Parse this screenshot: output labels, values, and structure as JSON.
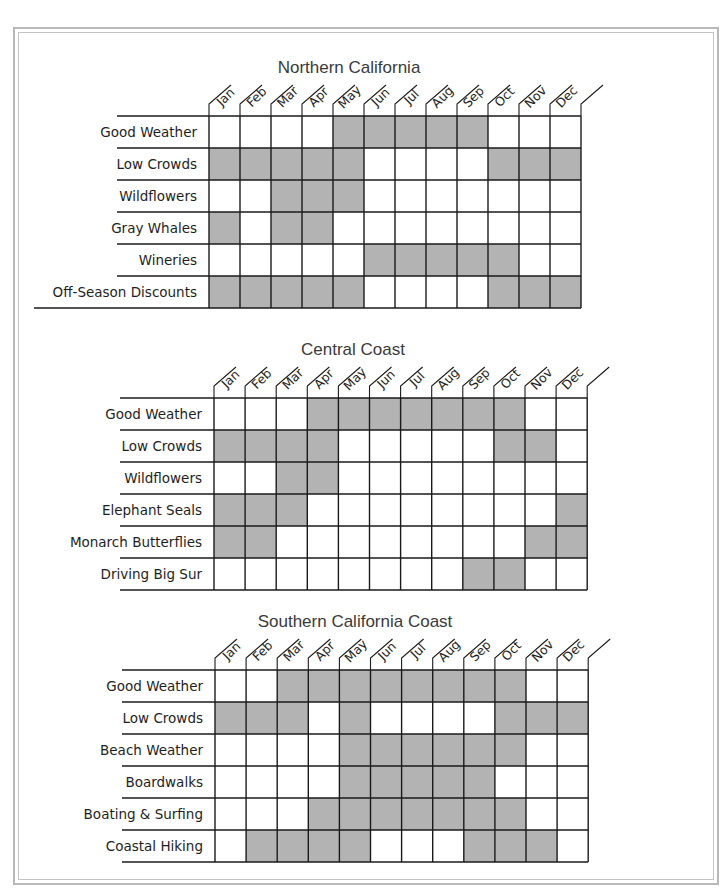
{
  "palette": {
    "filled": "#b3b3b3",
    "empty": "#ffffff",
    "line": "#1a1a1a",
    "frame": "#b9b9b9"
  },
  "months": [
    "Jan",
    "Feb",
    "Mar",
    "Apr",
    "May",
    "Jun",
    "Jul",
    "Aug",
    "Sep",
    "Oct",
    "Nov",
    "Dec"
  ],
  "chart_data": {
    "type": "heatmap",
    "title": "",
    "legend": "Shaded cell = recommended month for the activity/condition",
    "categories": [
      "Jan",
      "Feb",
      "Mar",
      "Apr",
      "May",
      "Jun",
      "Jul",
      "Aug",
      "Sep",
      "Oct",
      "Nov",
      "Dec"
    ],
    "sections": [
      {
        "title": "Northern California",
        "rows": [
          {
            "label": "Good Weather",
            "values": [
              0,
              0,
              0,
              0,
              1,
              1,
              1,
              1,
              1,
              0,
              0,
              0
            ]
          },
          {
            "label": "Low Crowds",
            "values": [
              1,
              1,
              1,
              1,
              1,
              0,
              0,
              0,
              0,
              1,
              1,
              1
            ]
          },
          {
            "label": "Wildflowers",
            "values": [
              0,
              0,
              1,
              1,
              1,
              0,
              0,
              0,
              0,
              0,
              0,
              0
            ]
          },
          {
            "label": "Gray Whales",
            "values": [
              1,
              0,
              1,
              1,
              0,
              0,
              0,
              0,
              0,
              0,
              0,
              0
            ]
          },
          {
            "label": "Wineries",
            "values": [
              0,
              0,
              0,
              0,
              0,
              1,
              1,
              1,
              1,
              1,
              0,
              0
            ]
          },
          {
            "label": "Off-Season Discounts",
            "values": [
              1,
              1,
              1,
              1,
              1,
              0,
              0,
              0,
              0,
              1,
              1,
              1
            ]
          }
        ]
      },
      {
        "title": "Central Coast",
        "rows": [
          {
            "label": "Good Weather",
            "values": [
              0,
              0,
              0,
              1,
              1,
              1,
              1,
              1,
              1,
              1,
              0,
              0
            ]
          },
          {
            "label": "Low Crowds",
            "values": [
              1,
              1,
              1,
              1,
              0,
              0,
              0,
              0,
              0,
              1,
              1,
              0
            ]
          },
          {
            "label": "Wildflowers",
            "values": [
              0,
              0,
              1,
              1,
              0,
              0,
              0,
              0,
              0,
              0,
              0,
              0
            ]
          },
          {
            "label": "Elephant Seals",
            "values": [
              1,
              1,
              1,
              0,
              0,
              0,
              0,
              0,
              0,
              0,
              0,
              1
            ]
          },
          {
            "label": "Monarch Butterflies",
            "values": [
              1,
              1,
              0,
              0,
              0,
              0,
              0,
              0,
              0,
              0,
              1,
              1
            ]
          },
          {
            "label": "Driving Big Sur",
            "values": [
              0,
              0,
              0,
              0,
              0,
              0,
              0,
              0,
              1,
              1,
              0,
              0
            ]
          }
        ]
      },
      {
        "title": "Southern California Coast",
        "rows": [
          {
            "label": "Good Weather",
            "values": [
              0,
              0,
              1,
              1,
              1,
              1,
              1,
              1,
              1,
              1,
              0,
              0
            ]
          },
          {
            "label": "Low Crowds",
            "values": [
              1,
              1,
              1,
              0,
              1,
              0,
              0,
              0,
              0,
              1,
              1,
              1
            ]
          },
          {
            "label": "Beach Weather",
            "values": [
              0,
              0,
              0,
              0,
              1,
              1,
              1,
              1,
              1,
              1,
              0,
              0
            ]
          },
          {
            "label": "Boardwalks",
            "values": [
              0,
              0,
              0,
              0,
              1,
              1,
              1,
              1,
              1,
              0,
              0,
              0
            ]
          },
          {
            "label": "Boating & Surfing",
            "values": [
              0,
              0,
              0,
              1,
              1,
              1,
              1,
              1,
              1,
              1,
              0,
              0
            ]
          },
          {
            "label": "Coastal Hiking",
            "values": [
              0,
              1,
              1,
              1,
              1,
              0,
              0,
              0,
              1,
              1,
              1,
              0
            ]
          }
        ]
      }
    ]
  },
  "layout": {
    "sections": [
      {
        "title_x": 349,
        "title_y": 73,
        "grid_x": 209,
        "grid_y": 116,
        "cell_w": 31.0,
        "cell_h": 32.0,
        "label_right": 197,
        "rule_left": 117,
        "last_rule_left": 34
      },
      {
        "title_x": 353,
        "title_y": 355,
        "grid_x": 214,
        "grid_y": 398,
        "cell_w": 31.1,
        "cell_h": 32.0,
        "label_right": 202,
        "rule_left": 120,
        "last_rule_left": 120
      },
      {
        "title_x": 355,
        "title_y": 627,
        "grid_x": 215,
        "grid_y": 670,
        "cell_w": 31.1,
        "cell_h": 32.0,
        "label_right": 203,
        "rule_left": 122,
        "last_rule_left": 122
      }
    ]
  }
}
